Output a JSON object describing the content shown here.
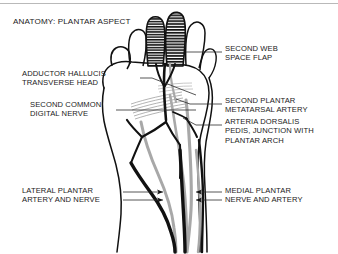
{
  "figure": {
    "title": "ANATOMY: PLANTAR ASPECT",
    "colors": {
      "nerve": "#111111",
      "artery": "#a8a8a8",
      "outline": "#111111",
      "leader": "#2b2b2b",
      "background": "#ffffff",
      "top_rule": "#b9b9b9"
    },
    "labels": {
      "second_web_space_flap": "SECOND WEB\nSPACE FLAP",
      "second_plantar_metatarsal_artery": "SECOND PLANTAR\nMETATARSAL ARTERY",
      "arteria_dorsalis_pedis": "ARTERIA DORSALIS\nPEDIS, JUNCTION WITH\nPLANTAR ARCH",
      "medial_plantar_nerve_and_artery": "MEDIAL PLANTAR\nNERVE AND ARTERY",
      "adductor_hallucis_transverse_head": "ADDUCTOR HALLUCIS\nTRANSVERSE HEAD",
      "second_common_digital_nerve": "SECOND COMMON\nDIGITAL NERVE",
      "lateral_plantar_artery_and_nerve": "LATERAL PLANTAR\nARTERY AND NERVE"
    }
  }
}
